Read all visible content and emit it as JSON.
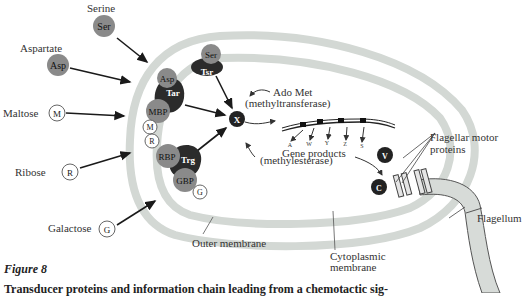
{
  "figure": {
    "title": "Figure 8",
    "caption": "Transducer proteins and information chain leading from a chemotactic sig-"
  },
  "attractants": [
    {
      "name": "Serine",
      "symbol": "Ser"
    },
    {
      "name": "Aspartate",
      "symbol": "Asp"
    },
    {
      "name": "Maltose",
      "symbol": "M"
    },
    {
      "name": "Ribose",
      "symbol": "R"
    },
    {
      "name": "Galactose",
      "symbol": "G"
    }
  ],
  "receptors": {
    "ser": "Ser",
    "tsr": "Tsr",
    "asp": "Asp",
    "tar": "Tar",
    "mbp": "MBP",
    "m": "M",
    "r": "R",
    "rbp": "RBP",
    "trg": "Trg",
    "gbp": "GBP",
    "g": "G"
  },
  "signals": {
    "x": "X",
    "ado_met": "Ado Met",
    "methyltransferase": "(methyltransferase)",
    "methylesterase": "(methylesterase)"
  },
  "genes": {
    "labels": [
      "A",
      "W",
      "Y",
      "Z",
      "S"
    ],
    "products": "Gene products"
  },
  "motor": {
    "v": "V",
    "c": "C",
    "label_line1": "Flagellar motor",
    "label_line2": "proteins"
  },
  "structures": {
    "flagellum": "Flagellum",
    "outer_membrane": "Outer membrane",
    "cytoplasmic_line1": "Cytoplasmic",
    "cytoplasmic_line2": "membrane"
  },
  "colors": {
    "membrane": "#d3d8d4",
    "binding_protein": "#8a8a8a",
    "transducer": "#2b2b2b",
    "open_circle": "#ffffff"
  }
}
